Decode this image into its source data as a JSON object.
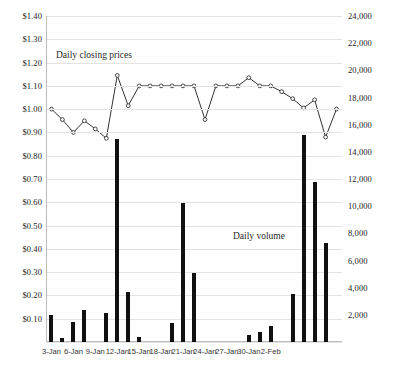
{
  "chart_data": {
    "type": "line",
    "title": "",
    "xlabel": "",
    "annotations": [
      {
        "text": "Daily closing prices",
        "name": "price-series-label"
      },
      {
        "text": "Daily volume",
        "name": "volume-series-label"
      }
    ],
    "grid": true,
    "legend_position": "none",
    "x_tick_labels": [
      "3-Jan",
      "6-Jan",
      "9-Jan",
      "12-Jan",
      "15-Jan",
      "18-Jan",
      "21-Jan",
      "24-Jan",
      "27-Jan",
      "30-Jan",
      "2-Feb"
    ],
    "left_axis": {
      "label": "",
      "ylim": [
        0,
        1.4
      ],
      "tick_labels": [
        "$0.00",
        "$0.10",
        "$0.20",
        "$0.30",
        "$0.40",
        "$0.50",
        "$0.60",
        "$0.70",
        "$0.80",
        "$0.90",
        "$1.00",
        "$1.10",
        "$1.20",
        "$1.30",
        "$1.40"
      ],
      "tick_values": [
        0,
        0.1,
        0.2,
        0.3,
        0.4,
        0.5,
        0.6,
        0.7,
        0.8,
        0.9,
        1.0,
        1.1,
        1.2,
        1.3,
        1.4
      ]
    },
    "right_axis": {
      "label": "",
      "ylim": [
        0,
        24000
      ],
      "tick_labels": [
        "0",
        "2,000",
        "4,000",
        "6,000",
        "8,000",
        "10,000",
        "12,000",
        "14,000",
        "16,000",
        "18,000",
        "20,000",
        "22,000",
        "24,000"
      ],
      "tick_values": [
        0,
        2000,
        4000,
        6000,
        8000,
        10000,
        12000,
        14000,
        16000,
        18000,
        20000,
        22000,
        24000
      ]
    },
    "series": [
      {
        "name": "Daily closing prices",
        "plot": "line",
        "axis": "left",
        "color": "#333333",
        "marker": "circle",
        "values": [
          1.0,
          0.955,
          0.9,
          0.95,
          0.915,
          0.875,
          1.145,
          1.015,
          1.1,
          1.1,
          1.1,
          1.1,
          1.1,
          1.1,
          0.955,
          1.1,
          1.1,
          1.1,
          1.135,
          1.1,
          1.1,
          1.075,
          1.045,
          1.005,
          1.04,
          0.88,
          1.0
        ]
      },
      {
        "name": "Daily volume",
        "plot": "bar",
        "axis": "right",
        "color": "#111111",
        "values": [
          2000,
          300,
          1500,
          2350,
          0,
          2100,
          14950,
          3700,
          350,
          0,
          0,
          1400,
          10250,
          5100,
          0,
          0,
          0,
          0,
          550,
          750,
          1150,
          0,
          3550,
          15250,
          11750,
          7300,
          0
        ]
      }
    ],
    "x_index_positions": [
      0,
      1,
      2,
      3,
      4,
      5,
      6,
      7,
      8,
      9,
      10,
      11,
      12,
      13,
      14,
      15,
      16,
      17,
      18,
      19,
      20,
      21,
      22,
      23,
      24,
      25,
      26
    ],
    "x_tick_indices": [
      0,
      2,
      4,
      6,
      8,
      10,
      12,
      14,
      16,
      18,
      20
    ]
  },
  "footnote": "",
  "colors": {
    "line": "#333333",
    "bar": "#111111",
    "grid": "#e3e3e3",
    "axis": "#bdbdbd",
    "text": "#222222"
  }
}
